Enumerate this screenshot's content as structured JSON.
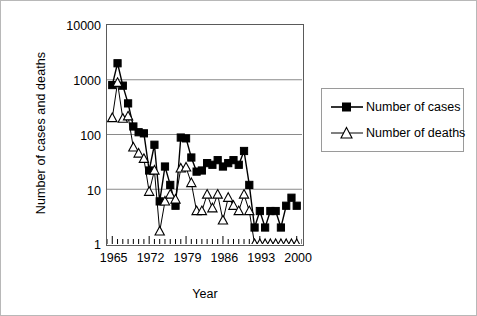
{
  "chart_data": {
    "type": "line",
    "title": "",
    "xlabel": "Year",
    "ylabel": "Number of cases and deaths",
    "yscale": "log",
    "ylim": [
      1,
      10000
    ],
    "ytick_labels": [
      "1",
      "10",
      "100",
      "1000",
      "10000"
    ],
    "ytick_values": [
      1,
      10,
      100,
      1000,
      10000
    ],
    "xlim": [
      1964,
      2001
    ],
    "xtick_labels": [
      "1965",
      "1972",
      "1979",
      "1986",
      "1993",
      "2000"
    ],
    "xtick_values": [
      1965,
      1972,
      1979,
      1986,
      1993,
      2000
    ],
    "grid": "horizontal",
    "legend_position": "right",
    "x": [
      1965,
      1966,
      1967,
      1968,
      1969,
      1970,
      1971,
      1972,
      1973,
      1974,
      1975,
      1976,
      1977,
      1978,
      1979,
      1980,
      1981,
      1982,
      1983,
      1984,
      1985,
      1986,
      1987,
      1988,
      1989,
      1990,
      1991,
      1992,
      1993,
      1994,
      1995,
      1996,
      1997,
      1998,
      1999,
      2000
    ],
    "series": [
      {
        "name": "Number of cases",
        "marker": "filled-square",
        "color": "#000000",
        "values": [
          800,
          2000,
          780,
          370,
          140,
          110,
          105,
          22,
          65,
          6,
          26,
          12,
          5,
          88,
          85,
          38,
          21,
          22,
          30,
          28,
          34,
          26,
          30,
          34,
          28,
          50,
          12,
          2,
          4,
          2,
          4,
          4,
          2,
          5,
          7,
          5
        ]
      },
      {
        "name": "Number of deaths",
        "marker": "open-triangle",
        "color": "#000000",
        "values": [
          200,
          880,
          195,
          215,
          58,
          45,
          36,
          9,
          22,
          1.7,
          6,
          8,
          6.5,
          24,
          25,
          13,
          4,
          4,
          8,
          4.5,
          8,
          2.7,
          7,
          5,
          4,
          8,
          4,
          1,
          1,
          1,
          1,
          1,
          1,
          1,
          1,
          1
        ]
      }
    ]
  },
  "legend": {
    "entries": [
      {
        "label": "Number of cases"
      },
      {
        "label": "Number of deaths"
      }
    ]
  }
}
